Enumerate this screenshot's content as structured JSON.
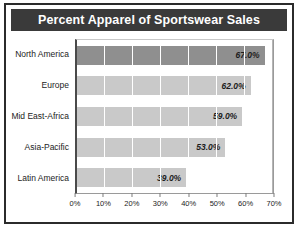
{
  "chart_data": {
    "type": "bar",
    "orientation": "horizontal",
    "title": "Percent Apparel of Sportswear Sales",
    "categories": [
      "North America",
      "Europe",
      "Mid East-Africa",
      "Asia-Pacific",
      "Latin America"
    ],
    "values": [
      67.0,
      62.0,
      59.0,
      53.0,
      39.0
    ],
    "value_labels": [
      "67.0%",
      "62.0%",
      "59.0%",
      "53.0%",
      "39.0%"
    ],
    "xlabel": "",
    "ylabel": "",
    "xlim": [
      0,
      70
    ],
    "xticks": [
      0,
      10,
      20,
      30,
      40,
      50,
      60,
      70
    ],
    "xtick_labels": [
      "0%",
      "10%",
      "20%",
      "30%",
      "40%",
      "50%",
      "60%",
      "70%"
    ],
    "grid": true,
    "legend": false,
    "highlight_index": 0,
    "colors": {
      "bar": "#c9c9c9",
      "bar_highlight": "#8f8f8f",
      "title_bar": "#3a3a3a",
      "title_text": "#ffffff",
      "frame": "#2b2b2b",
      "gridline": "#ffffff",
      "axis": "#4a4a4a",
      "text": "#1c1c1c",
      "background": "#ffffff"
    }
  }
}
